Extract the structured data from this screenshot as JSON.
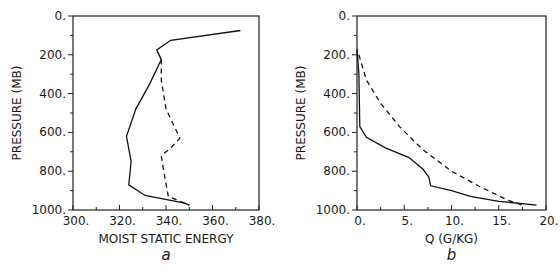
{
  "chart_data": [
    {
      "panel": "a",
      "type": "line",
      "xlabel": "MOIST STATIC ENERGY",
      "ylabel": "PRESSURE (MB)",
      "xlim": [
        300,
        380
      ],
      "ylim": [
        1000,
        0
      ],
      "xticks": [
        "300.",
        "320.",
        "340.",
        "360.",
        "380."
      ],
      "yticks": [
        "0.",
        "200.",
        "400.",
        "600.",
        "800.",
        "1000."
      ],
      "series": [
        {
          "name": "solid",
          "style": "solid",
          "x": [
            372,
            342,
            336,
            338,
            333,
            327,
            323,
            325,
            324,
            331,
            348,
            350
          ],
          "y": [
            75,
            125,
            175,
            225,
            350,
            480,
            620,
            750,
            870,
            925,
            965,
            975
          ]
        },
        {
          "name": "dashed",
          "style": "dashed",
          "x": [
            338,
            338,
            340,
            346,
            342,
            338,
            339,
            341,
            350
          ],
          "y": [
            225,
            330,
            480,
            630,
            680,
            720,
            800,
            930,
            975
          ]
        }
      ]
    },
    {
      "panel": "b",
      "type": "line",
      "xlabel": "Q (G/KG)",
      "ylabel": "PRESSURE (MB)",
      "xlim": [
        0,
        20
      ],
      "ylim": [
        1000,
        0
      ],
      "xticks": [
        "0.",
        "5.",
        "10.",
        "15.",
        "20."
      ],
      "yticks": [
        "0.",
        "200.",
        "400.",
        "600.",
        "800.",
        "1000."
      ],
      "series": [
        {
          "name": "solid",
          "style": "solid",
          "x": [
            0.0,
            0.2,
            0.3,
            1.0,
            3.0,
            5.5,
            7.0,
            7.6,
            7.8,
            10.0,
            12.0,
            15.0,
            19.0
          ],
          "y": [
            170,
            300,
            570,
            625,
            680,
            730,
            790,
            830,
            875,
            900,
            930,
            955,
            975
          ]
        },
        {
          "name": "dashed",
          "style": "dashed",
          "x": [
            0.2,
            1.0,
            2.5,
            4.5,
            7.0,
            10.0,
            13.0,
            16.0,
            17.5
          ],
          "y": [
            200,
            330,
            450,
            570,
            690,
            800,
            880,
            950,
            975
          ]
        }
      ]
    }
  ],
  "panels": {
    "a": {
      "label": "a",
      "xlabel": "MOIST STATIC ENERGY",
      "ylabel": "PRESSURE (MB)"
    },
    "b": {
      "label": "b",
      "xlabel": "Q (G/KG)",
      "ylabel": "PRESSURE (MB)"
    }
  }
}
